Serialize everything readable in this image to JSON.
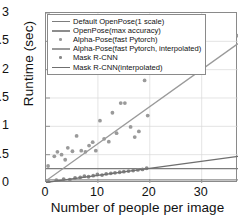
{
  "chart_data": {
    "type": "scatter",
    "title": "",
    "xlabel": "Number of people per image",
    "ylabel": "Runtime (sec)",
    "xlim": [
      0,
      37
    ],
    "ylim": [
      0,
      3
    ],
    "xticks": [
      0,
      10,
      20,
      30
    ],
    "yticks": [
      0,
      0.5,
      1,
      1.5,
      2,
      2.5,
      3
    ],
    "xtick_labels": [
      "0",
      "10",
      "20",
      "30"
    ],
    "ytick_labels": [
      "0",
      "0.5",
      "1",
      "1.5",
      "2",
      "2.5",
      "3"
    ],
    "grid": true,
    "legend_position": "upper-left",
    "series": [
      {
        "name": "Default OpenPose(1 scale)",
        "kind": "line",
        "color": "#7d7d7d",
        "points": [
          [
            0,
            0.255
          ],
          [
            37,
            0.255
          ]
        ]
      },
      {
        "name": "OpenPose(max accuracy)",
        "kind": "line",
        "color": "#8c8c8c",
        "points": [
          [
            0,
            0.055
          ],
          [
            37,
            0.055
          ]
        ]
      },
      {
        "name": "Alpha-Pose(fast Pytorch)",
        "kind": "scatter",
        "color": "#9a9a9a",
        "points": [
          [
            0.4,
            0.3
          ],
          [
            1.6,
            0.47
          ],
          [
            2.2,
            0.55
          ],
          [
            3.0,
            0.5
          ],
          [
            3.7,
            0.41
          ],
          [
            4.2,
            0.62
          ],
          [
            5.1,
            0.56
          ],
          [
            5.9,
            0.83
          ],
          [
            6.8,
            0.57
          ],
          [
            7.6,
            0.55
          ],
          [
            8.3,
            0.66
          ],
          [
            9.0,
            0.72
          ],
          [
            9.6,
            0.57
          ],
          [
            10.4,
            1.1
          ],
          [
            11.2,
            0.78
          ],
          [
            12.1,
            0.73
          ],
          [
            12.8,
            1.24
          ],
          [
            13.6,
            0.88
          ],
          [
            14.4,
            1.41
          ],
          [
            15.2,
            1.41
          ],
          [
            16.3,
            0.99
          ],
          [
            17.1,
            0.81
          ],
          [
            17.9,
            0.91
          ],
          [
            19.0,
            1.81
          ],
          [
            19.6,
            1.19
          ],
          [
            37.0,
            2.6
          ]
        ]
      },
      {
        "name": "Alpha-Pose(fast Pytorch, interpolated)",
        "kind": "line",
        "color": "#9a9a9a",
        "points": [
          [
            0,
            0.04
          ],
          [
            37,
            2.46
          ]
        ]
      },
      {
        "name": "Mask R-CNN",
        "kind": "scatter",
        "color": "#8a8a8a",
        "points": [
          [
            0.5,
            0.02
          ],
          [
            2.0,
            0.05
          ],
          [
            3.4,
            0.07
          ],
          [
            4.6,
            0.06
          ],
          [
            5.6,
            0.09
          ],
          [
            6.6,
            0.1
          ],
          [
            7.4,
            0.12
          ],
          [
            8.2,
            0.11
          ],
          [
            9.1,
            0.13
          ],
          [
            9.9,
            0.15
          ],
          [
            10.8,
            0.14
          ],
          [
            11.6,
            0.16
          ],
          [
            12.5,
            0.17
          ],
          [
            13.3,
            0.18
          ],
          [
            14.2,
            0.19
          ],
          [
            15.0,
            0.2
          ],
          [
            15.9,
            0.21
          ],
          [
            16.8,
            0.22
          ],
          [
            17.7,
            0.23
          ],
          [
            18.6,
            0.24
          ],
          [
            19.4,
            0.26
          ]
        ]
      },
      {
        "name": "Mask R-CNN(interpolated)",
        "kind": "line",
        "color": "#6f6f6f",
        "points": [
          [
            0,
            0.01
          ],
          [
            37,
            0.47
          ]
        ]
      }
    ]
  },
  "legend": {
    "items": [
      {
        "label": "Default OpenPose(1 scale)",
        "key": "line",
        "color": "#7d7d7d"
      },
      {
        "label": "OpenPose(max accuracy)",
        "key": "line",
        "color": "#8c8c8c"
      },
      {
        "label": "Alpha-Pose(fast Pytorch)",
        "key": "marker",
        "color": "#9a9a9a"
      },
      {
        "label": "Alpha-Pose(fast Pytorch, interpolated)",
        "key": "line",
        "color": "#9a9a9a"
      },
      {
        "label": "Mask R-CNN",
        "key": "marker",
        "color": "#8a8a8a"
      },
      {
        "label": "Mask R-CNN(interpolated)",
        "key": "line",
        "color": "#6f6f6f"
      }
    ]
  }
}
